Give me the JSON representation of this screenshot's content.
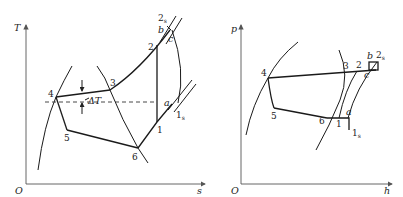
{
  "diagrams": [
    {
      "id": "ts",
      "title": "T-s diagram",
      "axis": {
        "y_label": "T",
        "x_label": "s",
        "origin_label": "O"
      },
      "points": {
        "p1": "1",
        "p1s": "1",
        "p1s_sub": "s",
        "p2": "2",
        "p2s": "2",
        "p2s_sub": "s",
        "p3": "3",
        "p4": "4",
        "p5": "5",
        "p6": "6",
        "a": "a",
        "b": "b",
        "c": "c"
      },
      "annotation": "ΔT"
    },
    {
      "id": "ph",
      "title": "p-h diagram",
      "axis": {
        "y_label": "p",
        "x_label": "h",
        "origin_label": "O"
      },
      "points": {
        "p1": "1",
        "p1s": "1",
        "p1s_sub": "s",
        "p2": "2",
        "p2s": "2",
        "p2s_sub": "s",
        "p3": "3",
        "p4": "4",
        "p5": "5",
        "p6": "6",
        "a": "a",
        "b": "b",
        "c": "c"
      }
    }
  ],
  "colors": {
    "line": "#1a1a1a",
    "axis": "#555555",
    "background": "#ffffff"
  }
}
